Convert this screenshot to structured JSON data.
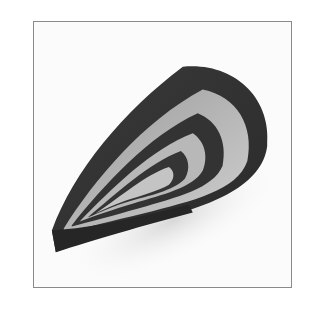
{
  "image": {
    "subject": "Paper quilling teardrop shape made of nested dark paper strips",
    "alt": "Quilled teardrop",
    "colors": {
      "background": "#ffffff",
      "frame_border": "#8a8a8a",
      "paper_dark": "#2e2e2e",
      "paper_mid": "#4a4a4a",
      "inner_light": "#bdbdbd",
      "shadow": "#e6e6e6"
    }
  }
}
